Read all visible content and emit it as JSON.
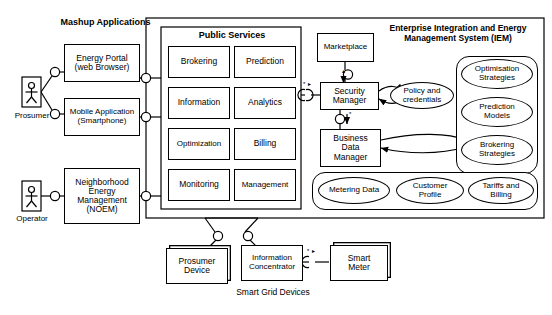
{
  "diagram": {
    "type": "uml-component-architecture",
    "title_bottom": "Smart Grid Devices",
    "groups": {
      "mashup": {
        "label": "Mashup\nApplications"
      },
      "public_services": {
        "label": "Public Services"
      },
      "iem": {
        "label": "Enterprise Integration and Energy\nManagement System (IEM)"
      }
    },
    "actors": [
      {
        "name": "Prosumer",
        "label": "Prosumer"
      },
      {
        "name": "Operator",
        "label": "Operator"
      }
    ],
    "mashup_apps": [
      {
        "label": "Energy Portal\n(web Browser)"
      },
      {
        "label": "Mobile Application\n(Smartphone)"
      }
    ],
    "noem": {
      "label": "Neighborhood\nEnergy\nManagement\n(NOEM)"
    },
    "services": [
      {
        "label": "Brokering"
      },
      {
        "label": "Prediction"
      },
      {
        "label": "Information"
      },
      {
        "label": "Analytics"
      },
      {
        "label": "Optimization"
      },
      {
        "label": "Billing"
      },
      {
        "label": "Monitoring"
      },
      {
        "label": "Management"
      }
    ],
    "managers": [
      {
        "label": "Marketplace"
      },
      {
        "label": "Security\nManager"
      },
      {
        "label": "Business\nData\nManager"
      }
    ],
    "policy_store": {
      "label": "Policy and\ncredentials"
    },
    "strategies": [
      {
        "label": "Optimisation\nStrategies"
      },
      {
        "label": "Prediction\nModels"
      },
      {
        "label": "Brokering\nStrategies"
      }
    ],
    "data_stores": [
      {
        "label": "Metering Data"
      },
      {
        "label": "Customer\nProfile"
      },
      {
        "label": "Tariffs and\nBilling"
      }
    ],
    "devices": [
      {
        "label": "Prosumer\nDevice"
      },
      {
        "label": "Information\nConcentrator"
      },
      {
        "label": "Smart\nMeter"
      }
    ],
    "colors": {
      "line": "#000000",
      "background": "#ffffff"
    }
  }
}
